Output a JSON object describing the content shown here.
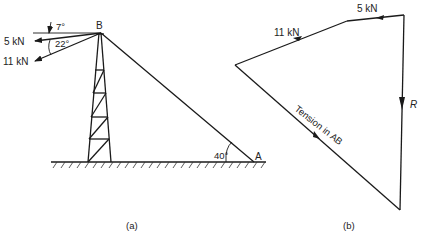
{
  "figure_a": {
    "caption": "(a)",
    "point_b": "B",
    "point_a": "A",
    "angle_7": "7°",
    "angle_22": "22°",
    "angle_40": "40°",
    "force_5": "5 kN",
    "force_11": "11 kN"
  },
  "figure_b": {
    "caption": "(b)",
    "force_5": "5 kN",
    "force_11": "11 kN",
    "resultant": "R",
    "tension": "Tension in AB"
  },
  "colors": {
    "line": "#1a1a1a",
    "background": "#ffffff"
  }
}
